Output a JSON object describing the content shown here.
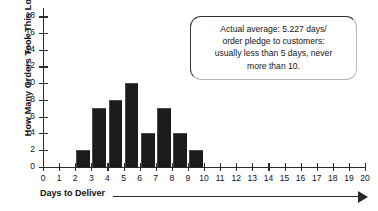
{
  "chart_data": {
    "type": "bar",
    "title": "",
    "xlabel": "Days to Deliver",
    "ylabel": "How Many Orders Took This Long",
    "categories": [
      0,
      1,
      2,
      3,
      4,
      5,
      6,
      7,
      8,
      9,
      10,
      11,
      12,
      13,
      14,
      15,
      16,
      17,
      18,
      19,
      20
    ],
    "values": [
      0,
      0,
      2,
      7,
      8,
      10,
      4,
      7,
      4,
      2,
      0,
      0,
      0,
      0,
      0,
      0,
      0,
      0,
      0,
      0,
      0
    ],
    "xlim": [
      0,
      20
    ],
    "ylim": [
      0,
      19
    ],
    "y_ticks": [
      0,
      2,
      4,
      6,
      8,
      10,
      12,
      14,
      16,
      18
    ],
    "x_ticks": [
      0,
      1,
      2,
      3,
      4,
      5,
      6,
      7,
      8,
      9,
      10,
      11,
      12,
      13,
      14,
      15,
      16,
      17,
      18,
      19,
      20
    ],
    "grid": false,
    "legend": null,
    "bar_color": "#1b1b1b",
    "axis_color": "#2b2b2b",
    "bar_alignment": "between-ticks",
    "annotations": [
      {
        "name": "average-callout",
        "lines": [
          "Actual average: 5.227 days/",
          "order pledge to customers:",
          "usually less than 5 days, never",
          "more than 10."
        ]
      }
    ]
  }
}
